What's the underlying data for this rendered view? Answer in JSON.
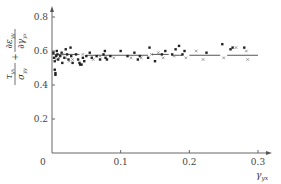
{
  "chart_data": {
    "type": "scatter",
    "title": "",
    "xlabel": "γ_yx",
    "ylabel": "τ_yx/σ_yy + ∂ε_yy/∂γ_yx",
    "xlim": [
      0,
      0.31
    ],
    "ylim": [
      0,
      0.85
    ],
    "grid": false,
    "legend": "none",
    "x_ticks": [
      {
        "value": 0,
        "label": "0"
      },
      {
        "value": 0.1,
        "label": "0.1"
      },
      {
        "value": 0.2,
        "label": "0.2"
      },
      {
        "value": 0.3,
        "label": "0.3"
      }
    ],
    "y_ticks": [
      {
        "value": 0.2,
        "label": "0.2"
      },
      {
        "value": 0.4,
        "label": "0.4"
      },
      {
        "value": 0.6,
        "label": "0.6"
      },
      {
        "value": 0.8,
        "label": "0.8"
      }
    ],
    "series": [
      {
        "name": "filled",
        "marker": "dot",
        "points": [
          [
            0.002,
            0.59
          ],
          [
            0.003,
            0.56
          ],
          [
            0.004,
            0.54
          ],
          [
            0.004,
            0.49
          ],
          [
            0.005,
            0.46
          ],
          [
            0.005,
            0.47
          ],
          [
            0.006,
            0.57
          ],
          [
            0.007,
            0.6
          ],
          [
            0.008,
            0.58
          ],
          [
            0.009,
            0.55
          ],
          [
            0.012,
            0.57
          ],
          [
            0.014,
            0.59
          ],
          [
            0.015,
            0.53
          ],
          [
            0.018,
            0.56
          ],
          [
            0.02,
            0.61
          ],
          [
            0.022,
            0.58
          ],
          [
            0.024,
            0.55
          ],
          [
            0.027,
            0.62
          ],
          [
            0.028,
            0.57
          ],
          [
            0.03,
            0.53
          ],
          [
            0.035,
            0.58
          ],
          [
            0.038,
            0.55
          ],
          [
            0.04,
            0.53
          ],
          [
            0.041,
            0.52
          ],
          [
            0.043,
            0.52
          ],
          [
            0.045,
            0.56
          ],
          [
            0.047,
            0.54
          ],
          [
            0.05,
            0.57
          ],
          [
            0.055,
            0.59
          ],
          [
            0.058,
            0.56
          ],
          [
            0.065,
            0.57
          ],
          [
            0.07,
            0.55
          ],
          [
            0.075,
            0.58
          ],
          [
            0.077,
            0.6
          ],
          [
            0.078,
            0.56
          ],
          [
            0.08,
            0.55
          ],
          [
            0.085,
            0.57
          ],
          [
            0.1,
            0.6
          ],
          [
            0.11,
            0.57
          ],
          [
            0.12,
            0.59
          ],
          [
            0.125,
            0.55
          ],
          [
            0.128,
            0.57
          ],
          [
            0.14,
            0.56
          ],
          [
            0.142,
            0.62
          ],
          [
            0.15,
            0.54
          ],
          [
            0.16,
            0.58
          ],
          [
            0.165,
            0.6
          ],
          [
            0.175,
            0.58
          ],
          [
            0.18,
            0.61
          ],
          [
            0.185,
            0.63
          ],
          [
            0.19,
            0.58
          ],
          [
            0.193,
            0.6
          ],
          [
            0.225,
            0.59
          ],
          [
            0.248,
            0.64
          ],
          [
            0.26,
            0.61
          ],
          [
            0.263,
            0.62
          ],
          [
            0.28,
            0.62
          ]
        ]
      },
      {
        "name": "open",
        "marker": "cross",
        "points": [
          [
            0.006,
            0.55
          ],
          [
            0.01,
            0.56
          ],
          [
            0.016,
            0.58
          ],
          [
            0.02,
            0.56
          ],
          [
            0.025,
            0.54
          ],
          [
            0.03,
            0.55
          ],
          [
            0.045,
            0.58
          ],
          [
            0.06,
            0.55
          ],
          [
            0.07,
            0.57
          ],
          [
            0.09,
            0.56
          ],
          [
            0.115,
            0.56
          ],
          [
            0.13,
            0.56
          ],
          [
            0.145,
            0.58
          ],
          [
            0.155,
            0.59
          ],
          [
            0.162,
            0.56
          ],
          [
            0.178,
            0.57
          ],
          [
            0.195,
            0.56
          ],
          [
            0.21,
            0.6
          ],
          [
            0.22,
            0.55
          ],
          [
            0.25,
            0.56
          ],
          [
            0.268,
            0.62
          ],
          [
            0.283,
            0.6
          ],
          [
            0.285,
            0.55
          ]
        ]
      }
    ],
    "mean_segments": [
      {
        "x0": 0.0,
        "x1": 0.04,
        "y": 0.58
      },
      {
        "x0": 0.05,
        "x1": 0.14,
        "y": 0.575
      },
      {
        "x0": 0.145,
        "x1": 0.17,
        "y": 0.58
      },
      {
        "x0": 0.175,
        "x1": 0.19,
        "y": 0.575
      },
      {
        "x0": 0.2,
        "x1": 0.245,
        "y": 0.575
      },
      {
        "x0": 0.255,
        "x1": 0.3,
        "y": 0.575
      }
    ]
  },
  "axes": {
    "origin_label": "0",
    "x_axis_name": "γ",
    "x_axis_sub": "yx",
    "y_label_parts": {
      "num1": "τ",
      "num1_sub": "yx",
      "den1": "σ",
      "den1_sub": "yy",
      "plus": "+",
      "num2": "∂ε",
      "num2_sub": "yy",
      "den2": "∂γ",
      "den2_sub": "yx"
    }
  }
}
